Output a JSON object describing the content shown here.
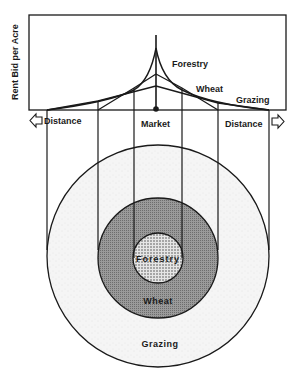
{
  "graph": {
    "y_axis_label": "Rent Bid per Acre",
    "curve_labels": {
      "forestry": "Forestry",
      "wheat": "Wheat",
      "grazing": "Grazing"
    },
    "x_center_label": "Market",
    "x_left_label": "Distance",
    "x_right_label": "Distance",
    "icons": {
      "left": "arrow-left-icon",
      "right": "arrow-right-icon"
    }
  },
  "rings": {
    "inner": "Forestry",
    "middle": "Wheat",
    "outer": "Grazing"
  },
  "colors": {
    "line": "#1a1a1a",
    "forestry_fill": "#d6d6d6",
    "wheat_fill": "#8f8f8f",
    "grazing_fill": "#f2f2f2",
    "background": "#ffffff"
  }
}
